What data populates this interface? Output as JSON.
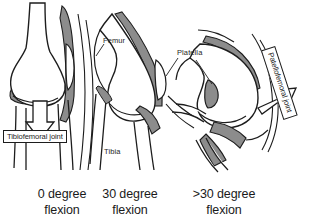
{
  "figure": {
    "background_color": "#ffffff",
    "line_color": "#1d1d1d",
    "shade_color": "#8c8c8c",
    "arrow_fill": "#ffffff"
  },
  "anatomy_labels": {
    "femur": "Femur",
    "platella": "Platella",
    "tibia": "Tibia"
  },
  "boxed_labels": {
    "tibiofemoral": "Tibiofemoral joint",
    "patellofemoral": "Patellofemoral joint"
  },
  "panels": [
    {
      "id": "panel-0-degree",
      "caption_line1": "0 degree",
      "caption_line2": "flexion",
      "arrow": "down-arrow",
      "arrow_direction": "down"
    },
    {
      "id": "panel-30-degree",
      "caption_line1": "30 degree",
      "caption_line2": "flexion",
      "arrow": "none",
      "arrow_direction": ""
    },
    {
      "id": "panel-over-30-degree",
      "caption_line1": ">30 degree",
      "caption_line2": "flexion",
      "arrow": "up-right-arrow",
      "arrow_direction": "up-right"
    }
  ]
}
